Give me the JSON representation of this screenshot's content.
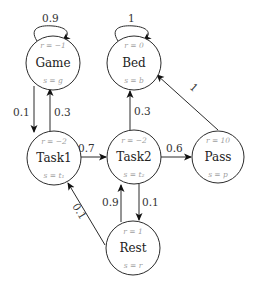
{
  "diagram": {
    "type": "markov-reward-process",
    "nodes": [
      {
        "id": "game",
        "name": "Game",
        "reward": "r = −1",
        "state": "s = g"
      },
      {
        "id": "bed",
        "name": "Bed",
        "reward": "r = 0",
        "state": "s = b"
      },
      {
        "id": "task1",
        "name": "Task1",
        "reward": "r = −2",
        "state": "s = t₁"
      },
      {
        "id": "task2",
        "name": "Task2",
        "reward": "r = −2",
        "state": "s = t₂"
      },
      {
        "id": "pass",
        "name": "Pass",
        "reward": "r = 10",
        "state": "s = p"
      },
      {
        "id": "rest",
        "name": "Rest",
        "reward": "r = 1",
        "state": "s = r"
      }
    ],
    "edges": [
      {
        "from": "game",
        "to": "game",
        "label": "0.9"
      },
      {
        "from": "bed",
        "to": "bed",
        "label": "1"
      },
      {
        "from": "game",
        "to": "task1",
        "label": "0.1"
      },
      {
        "from": "task1",
        "to": "game",
        "label": "0.3"
      },
      {
        "from": "task1",
        "to": "task2",
        "label": "0.7"
      },
      {
        "from": "task2",
        "to": "bed",
        "label": "0.3"
      },
      {
        "from": "task2",
        "to": "pass",
        "label": "0.6"
      },
      {
        "from": "task2",
        "to": "rest",
        "label": "0.1"
      },
      {
        "from": "rest",
        "to": "task2",
        "label": "0.9"
      },
      {
        "from": "rest",
        "to": "task1",
        "label": "0.1"
      },
      {
        "from": "pass",
        "to": "bed",
        "label": "1"
      }
    ]
  }
}
